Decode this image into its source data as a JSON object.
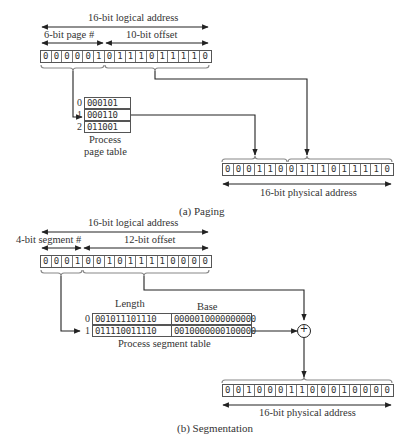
{
  "paging": {
    "logical_label": "16-bit logical address",
    "page_label": "6-bit page #",
    "offset_label": "10-bit offset",
    "logical_bits": [
      "0",
      "0",
      "0",
      "0",
      "0",
      "1",
      "0",
      "1",
      "1",
      "1",
      "0",
      "1",
      "1",
      "1",
      "1",
      "0"
    ],
    "page_table": {
      "rows": [
        {
          "index": "0",
          "value": "000101"
        },
        {
          "index": "1",
          "value": "000110"
        },
        {
          "index": "2",
          "value": "011001"
        }
      ],
      "caption_line1": "Process",
      "caption_line2": "page table"
    },
    "physical_bits": [
      "0",
      "0",
      "0",
      "1",
      "1",
      "0",
      "0",
      "1",
      "1",
      "1",
      "0",
      "1",
      "1",
      "1",
      "1",
      "0"
    ],
    "physical_label": "16-bit physical address",
    "caption": "(a) Paging"
  },
  "segmentation": {
    "logical_label": "16-bit logical address",
    "segment_label": "4-bit segment #",
    "offset_label": "12-bit offset",
    "logical_bits": [
      "0",
      "0",
      "0",
      "1",
      "0",
      "0",
      "1",
      "0",
      "1",
      "1",
      "1",
      "1",
      "0",
      "0",
      "0",
      "0"
    ],
    "segment_table": {
      "length_header": "Length",
      "base_header": "Base",
      "rows": [
        {
          "index": "0",
          "length": "001011101110",
          "base": "0000010000000000"
        },
        {
          "index": "1",
          "length": "011110011110",
          "base": "0010000000100000"
        }
      ],
      "caption": "Process segment table"
    },
    "adder_symbol": "+",
    "physical_bits": [
      "0",
      "0",
      "1",
      "0",
      "0",
      "0",
      "1",
      "1",
      "0",
      "0",
      "0",
      "1",
      "0",
      "0",
      "0",
      "0"
    ],
    "physical_label": "16-bit physical address",
    "caption": "(b) Segmentation"
  }
}
